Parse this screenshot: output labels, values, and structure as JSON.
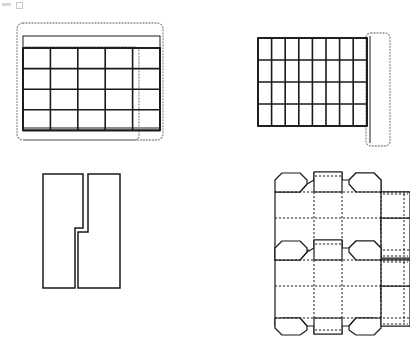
{
  "page": {
    "background_color": "#ffffff",
    "line_color": "#1a1a1a",
    "dashed_color": "#8c8c8c",
    "width": 410,
    "height": 340,
    "figure_count": 4
  },
  "figures": [
    {
      "id": "fig-top-left",
      "name": "tray-grid-with-offset-outline",
      "label": "",
      "type": "grid-tray",
      "position": {
        "x": 14,
        "y": 18,
        "width": 160,
        "height": 128
      },
      "grid": {
        "columns": 5,
        "rows": 5,
        "cell_width": 27.4,
        "cell_height": 20.6,
        "origin_x": 23,
        "origin_y": 48,
        "stroke_width": 1.6
      },
      "solid_outline": {
        "x": 23,
        "y": 36,
        "width": 137,
        "height": 92,
        "stroke_width": 1.0
      },
      "dashed_outline": {
        "description": "offset rounded dashed rectangle enclosing the grid, shifted up-left",
        "x": 17,
        "y": 23,
        "width": 146,
        "height": 117,
        "corner_radius": 6,
        "dash": "1,2"
      },
      "dashed_inner_outline": {
        "description": "second dashed rectangle aligned to the grid top-left",
        "x": 23,
        "y": 47,
        "width": 116,
        "height": 93,
        "corner_radius": 5,
        "dash": "1,2"
      }
    },
    {
      "id": "fig-top-right",
      "name": "wide-grid-with-right-dashed-strip",
      "label": "",
      "type": "grid-tray",
      "position": {
        "x": 256,
        "y": 28,
        "width": 150,
        "height": 120
      },
      "grid": {
        "columns": 8,
        "rows": 4,
        "cell_width": 13.6,
        "cell_height": 22.0,
        "origin_x": 258,
        "origin_y": 38,
        "stroke_width": 1.6
      },
      "dashed_outline": {
        "description": "narrow rounded dashed strip along the right edge of the grid",
        "x": 366,
        "y": 33,
        "width": 24,
        "height": 113,
        "corner_radius": 5,
        "dash": "1,2"
      }
    },
    {
      "id": "fig-bottom-left",
      "name": "interlocking-puzzle-pieces",
      "label": "",
      "type": "outline-pair",
      "position": {
        "x": 40,
        "y": 172,
        "width": 82,
        "height": 118
      },
      "pieces": [
        {
          "name": "left-piece-step-shape",
          "points": "43,174 83,174 83,228 75,228 75,288 43,288",
          "stroke_width": 1.5
        },
        {
          "name": "right-piece-step-shape",
          "points": "88,174 120,174 120,288 78,288 78,232 88,232",
          "stroke_width": 1.5
        }
      ]
    },
    {
      "id": "fig-bottom-right",
      "name": "carton-dieline-net",
      "label": "",
      "type": "packaging-net",
      "position": {
        "x": 262,
        "y": 168,
        "width": 146,
        "height": 164
      },
      "description": "Two stacked identical carton blanks with fold lines shown dashed and cut lines shown solid. Each blank has a central panel row, top and bottom end flaps, glue tabs at the right, and tapered side flaps.",
      "halves": 2,
      "fold_line_style": "dashed",
      "cut_line_style": "solid",
      "stroke_width": 1.2
    }
  ]
}
